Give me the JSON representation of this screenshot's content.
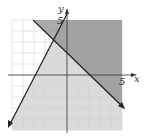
{
  "graph": {
    "axis_labels": {
      "x": "x",
      "y": "y"
    },
    "tick_labels": {
      "x": "5",
      "y": "5"
    },
    "grid": {
      "min": -5,
      "max": 5
    },
    "colors": {
      "light_shade": "#d6d6d6",
      "dark_shade": "#9a9a9a",
      "grid": "#cfcfcf",
      "line": "#222222",
      "background": "#ffffff"
    }
  }
}
